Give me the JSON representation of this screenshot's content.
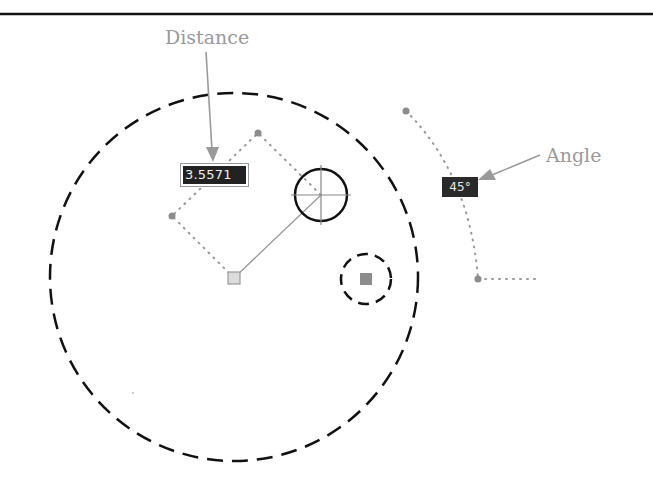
{
  "callouts": {
    "distance_label": "Distance",
    "angle_label": "Angle"
  },
  "dynamic_input": {
    "distance_value": "3.5571",
    "angle_value": "45°"
  },
  "colors": {
    "line": "#111111",
    "grip": "#8c8c8c",
    "callout": "#9a9a9a",
    "tooltip_bg": "#222222",
    "tooltip_text": "#f0f0f0"
  }
}
